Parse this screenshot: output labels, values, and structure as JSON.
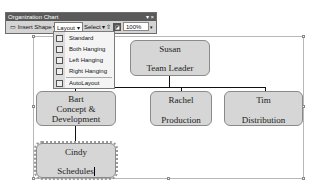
{
  "toolbar": {
    "title": "Organization Chart",
    "window_controls": "▾ ×",
    "insert_shape_label": "Insert Shape",
    "layout_label": "Layout",
    "select_label": "Select",
    "zoom_value": "100%"
  },
  "layout_menu": {
    "items": [
      {
        "label": "Standard",
        "icon": "standard-layout-icon"
      },
      {
        "label": "Both Hanging",
        "icon": "both-hanging-icon"
      },
      {
        "label": "Left Hanging",
        "icon": "left-hanging-icon"
      },
      {
        "label": "Right Hanging",
        "icon": "right-hanging-icon"
      },
      {
        "label": "AutoLayout",
        "icon": "autolayout-icon"
      }
    ]
  },
  "org_chart": {
    "root": {
      "name": "Susan",
      "role": "Team Leader"
    },
    "children": [
      {
        "name": "Bart",
        "role": "Concept & Development"
      },
      {
        "name": "Rachel",
        "role": "Production"
      },
      {
        "name": "Tim",
        "role": "Distribution"
      }
    ],
    "grandchild": {
      "name": "Cindy",
      "role": "Schedules",
      "editing": true
    }
  }
}
